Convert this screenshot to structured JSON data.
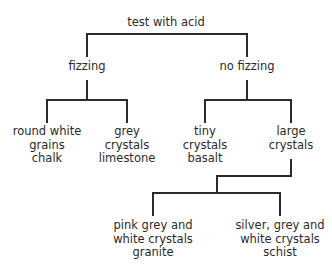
{
  "diagram": {
    "root": {
      "label": "test with acid"
    },
    "branches": {
      "fizzing": {
        "label": "fizzing"
      },
      "no_fizzing": {
        "label": "no fizzing"
      }
    },
    "nodes": {
      "round_white": {
        "line1": "round white",
        "line2": "grains",
        "rock": "chalk"
      },
      "grey_crystals": {
        "line1": "grey",
        "line2": "crystals",
        "rock": "limestone"
      },
      "tiny_crystals": {
        "line1": "tiny",
        "line2": "crystals",
        "rock": "basalt"
      },
      "large_crystals": {
        "line1": "large",
        "line2": "crystals"
      },
      "pink_grey": {
        "line1": "pink grey and",
        "line2": "white crystals",
        "rock": "granite"
      },
      "silver_grey": {
        "line1": "silver, grey and",
        "line2": "white crystals",
        "rock": "schist"
      }
    },
    "line_color": "#2b2b2b"
  }
}
